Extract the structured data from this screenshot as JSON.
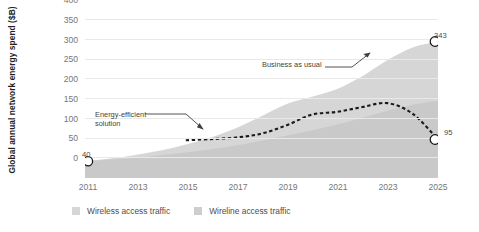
{
  "chart_data": {
    "type": "area",
    "title": "",
    "subtitle": "",
    "xlabel": "",
    "ylabel": "Global annual network energy spend ($B)",
    "xlim": [
      2011,
      2025
    ],
    "ylim": [
      0,
      400
    ],
    "grid": true,
    "x": [
      2011,
      2012,
      2013,
      2014,
      2015,
      2016,
      2017,
      2018,
      2019,
      2020,
      2021,
      2022,
      2023,
      2024,
      2025
    ],
    "yticks": [
      0,
      50,
      100,
      150,
      200,
      250,
      300,
      350,
      400
    ],
    "xticks": [
      2011,
      2013,
      2015,
      2017,
      2019,
      2021,
      2023,
      2025
    ],
    "stacked": true,
    "series": [
      {
        "name": "Wireline access traffic",
        "type": "area",
        "color": "#c9c9c9",
        "values": [
          40,
          44,
          49,
          55,
          62,
          70,
          80,
          92,
          105,
          118,
          133,
          150,
          168,
          183,
          193
        ]
      },
      {
        "name": "Wireless access traffic",
        "type": "area",
        "color": "#d6d6d6",
        "values": [
          0,
          3,
          7,
          12,
          20,
          30,
          44,
          62,
          80,
          85,
          90,
          105,
          128,
          145,
          150
        ]
      },
      {
        "name": "Energy-efficient solution",
        "type": "line",
        "style": "dashed",
        "color": "#1a1a1a",
        "values": [
          null,
          null,
          null,
          null,
          93,
          96,
          100,
          110,
          131,
          158,
          165,
          177,
          187,
          160,
          95
        ]
      }
    ],
    "annotations": [
      {
        "id": "business-as-usual",
        "text": "Business as usual",
        "points_to": "total-area-upper-boundary"
      },
      {
        "id": "energy-efficient-solution",
        "text_line1": "Energy-efficient",
        "text_line2": "solution",
        "points_to": "dashed-line"
      }
    ],
    "point_labels": [
      {
        "id": "start",
        "x": 2011,
        "value": 40,
        "label": "40"
      },
      {
        "id": "business-as-usual-end",
        "x": 2025,
        "value": 343,
        "label": "343"
      },
      {
        "id": "energy-efficient-end",
        "x": 2025,
        "value": 95,
        "label": "95"
      }
    ],
    "legend_position": "bottom-left"
  },
  "axis": {
    "y_title": "Global annual network energy spend ($B)",
    "y_ticks": [
      "400",
      "350",
      "300",
      "250",
      "200",
      "150",
      "100",
      "50",
      "0"
    ],
    "x_ticks": [
      "2011",
      "2013",
      "2015",
      "2017",
      "2019",
      "2021",
      "2023",
      "2025"
    ]
  },
  "annotations": {
    "business_as_usual": "Business as usual",
    "energy_efficient_line1": "Energy-efficient",
    "energy_efficient_line2": "solution"
  },
  "labels": {
    "start_value": "40",
    "bau_end_value": "343",
    "eff_end_value": "95"
  },
  "legend": {
    "items": [
      {
        "label": "Wireless access traffic",
        "color": "#d6d6d6"
      },
      {
        "label": "Wireline access traffic",
        "color": "#cdcdcd"
      }
    ]
  },
  "colors": {
    "wireless_fill": "#d6d6d6",
    "wireline_fill": "#c9c9c9",
    "dashed_line": "#1a1a1a",
    "gridline": "#e9e9e9",
    "tick_text": "#77767a",
    "axis_title": "#231f20"
  }
}
